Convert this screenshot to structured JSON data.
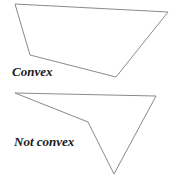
{
  "figures": [
    {
      "id": "convex",
      "label": "Convex",
      "points": "15,4 168,12 116,77 30,55",
      "label_pos": {
        "left": 12,
        "top": 64
      }
    },
    {
      "id": "not-convex",
      "label": "Not convex",
      "points": "15,93 156,96 114,174 88,122",
      "label_pos": {
        "left": 14,
        "top": 134
      }
    }
  ],
  "colors": {
    "stroke": "#8a8a8a",
    "text": "#1a1a1a",
    "background": "#ffffff"
  }
}
